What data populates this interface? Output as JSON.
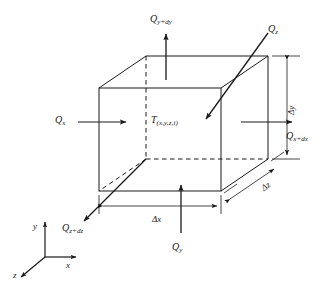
{
  "figure": {
    "type": "3d-control-volume-heat-balance",
    "background_color": "#ffffff",
    "line_color": "#1a1a1a"
  },
  "center_label": {
    "base": "T",
    "sub": "(x,y,z,t)"
  },
  "heat_flux_labels": {
    "q_y_out": {
      "base": "Q",
      "sub": "y+dy",
      "position": "top"
    },
    "q_z_in": {
      "base": "Q",
      "sub": "z",
      "position": "top-right"
    },
    "q_x_in": {
      "base": "Q",
      "sub": "x",
      "position": "left"
    },
    "q_x_out": {
      "base": "Q",
      "sub": "x+dx",
      "position": "right"
    },
    "q_y_in": {
      "base": "Q",
      "sub": "y",
      "position": "bottom"
    },
    "q_z_out": {
      "base": "Q",
      "sub": "z+dz",
      "position": "bottom-left"
    }
  },
  "dimension_labels": {
    "dx": {
      "base": "Δx"
    },
    "dy": {
      "base": "Δy"
    },
    "dz": {
      "base": "Δz"
    }
  },
  "axes": {
    "x": "x",
    "y": "y",
    "z": "z"
  }
}
